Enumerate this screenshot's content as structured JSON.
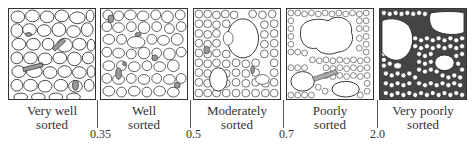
{
  "diagram": {
    "type": "sorting-comparison-chart",
    "panels": [
      {
        "id": "very-well",
        "label_line1": "Very well",
        "label_line2": "sorted"
      },
      {
        "id": "well",
        "label_line1": "Well",
        "label_line2": "sorted"
      },
      {
        "id": "moderately",
        "label_line1": "Moderately",
        "label_line2": "sorted"
      },
      {
        "id": "poorly",
        "label_line1": "Poorly",
        "label_line2": "sorted"
      },
      {
        "id": "very-poorly",
        "label_line1": "Very poorly",
        "label_line2": "sorted"
      }
    ],
    "thresholds": [
      "0.35",
      "0.5",
      "0.7",
      "2.0"
    ],
    "colors": {
      "outline": "#333333",
      "grain_fill": "#ffffff",
      "matrix_dark": "#555555",
      "highlight_grain": "#999999"
    }
  }
}
